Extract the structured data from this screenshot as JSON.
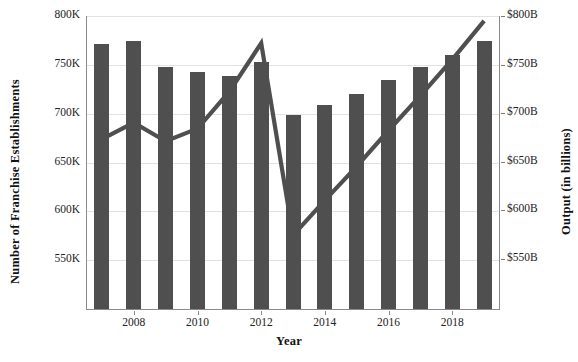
{
  "chart_data": {
    "type": "bar",
    "title": "",
    "xlabel": "Year",
    "ylabel": "Number of Franchise Establishments",
    "ylabel_right": "Output (in billions)",
    "grid": true,
    "legend": "none",
    "categories": [
      "2007",
      "2008",
      "2009",
      "2010",
      "2011",
      "2012",
      "2013",
      "2014",
      "2015",
      "2016",
      "2017",
      "2018",
      "2019"
    ],
    "x_tick_labels": [
      "2008",
      "2010",
      "2012",
      "2014",
      "2016",
      "2018"
    ],
    "ylim": [
      499000,
      800000
    ],
    "y_ticks": [
      800000,
      750000,
      700000,
      650000,
      600000,
      550000
    ],
    "y_tick_labels": [
      "800K",
      "750K",
      "700K",
      "650K",
      "600K",
      "550K"
    ],
    "ylim_right": [
      497,
      800
    ],
    "y_ticks_right": [
      800,
      750,
      700,
      650,
      600,
      550
    ],
    "y_tick_labels_right": [
      "$800B",
      "$750B",
      "$700B",
      "$650B",
      "$600B",
      "$550B"
    ],
    "series": [
      {
        "name": "Number of Franchise Establishments",
        "kind": "bar",
        "axis": "left",
        "color": "#4f4f4f",
        "values": [
          771000,
          774000,
          748000,
          743000,
          739000,
          753000,
          699000,
          709000,
          720000,
          735000,
          748000,
          760000,
          774000
        ]
      },
      {
        "name": "Output (in billions)",
        "kind": "line",
        "axis": "right",
        "color": "#4f4f4f",
        "values": [
          673,
          690,
          671,
          684,
          722,
          772,
          574,
          610,
          645,
          682,
          718,
          755,
          795
        ]
      }
    ]
  },
  "axes": {
    "left_title": "Number of Franchise Establishments",
    "right_title": "Output (in billions)",
    "bottom_title": "Year"
  }
}
